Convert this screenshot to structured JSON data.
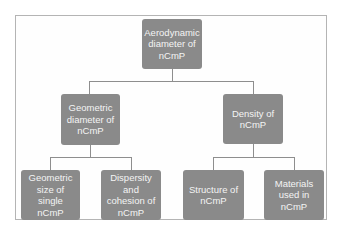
{
  "diagram": {
    "type": "tree",
    "root": {
      "label": "Aerodynamic diameter of nCmP"
    },
    "level2": [
      {
        "label": "Geometric diameter of nCmP"
      },
      {
        "label": "Density of nCmP"
      }
    ],
    "level3": [
      {
        "label": "Geometric size of single nCmP",
        "parent": "Geometric diameter of nCmP"
      },
      {
        "label": "Dispersity and cohesion of nCmP",
        "parent": "Geometric diameter of nCmP"
      },
      {
        "label": "Structure of nCmP",
        "parent": "Density of nCmP"
      },
      {
        "label": "Materials used in nCmP",
        "parent": "Density of nCmP"
      }
    ],
    "colors": {
      "node_fill": "#8a8a8a",
      "node_text": "#f4f4f4",
      "connector": "#8e8e8e",
      "frame_border": "#b4b4b4"
    }
  }
}
